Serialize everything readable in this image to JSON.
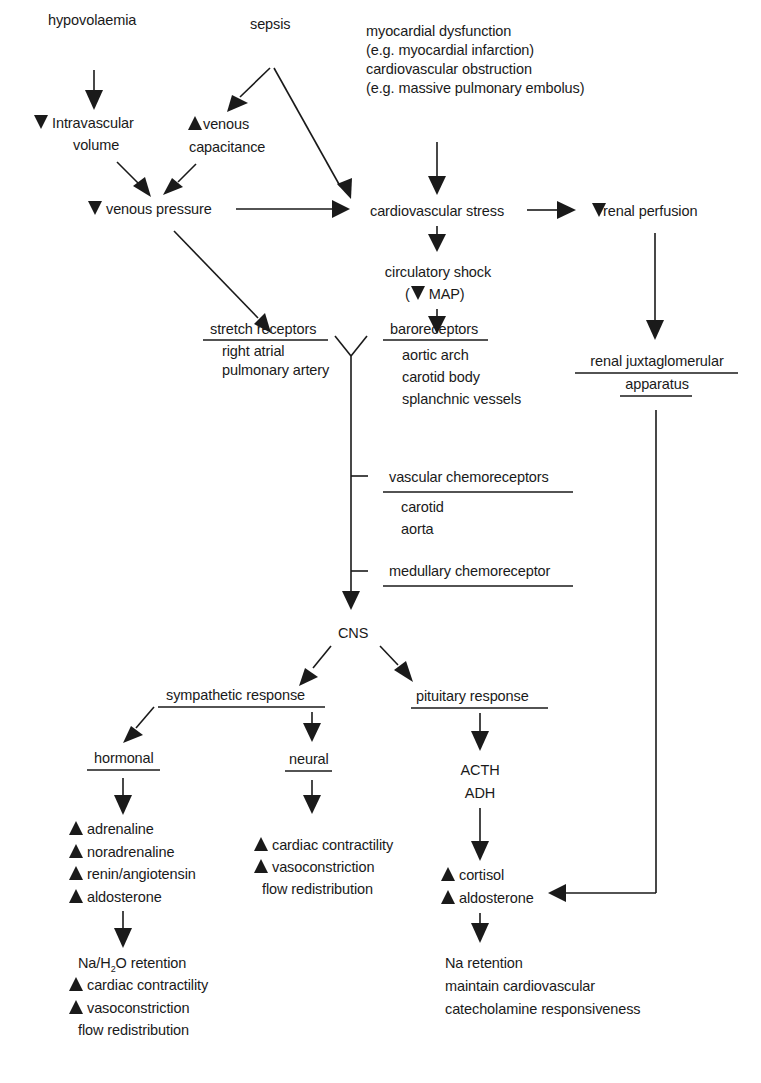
{
  "colors": {
    "ink": "#1a1a1a",
    "background": "#ffffff"
  },
  "causes": {
    "hypovolaemia": "hypovolaemia",
    "sepsis": "sepsis",
    "cardiac": [
      "myocardial dysfunction",
      "(e.g. myocardial infarction)",
      "cardiovascular obstruction",
      "(e.g. massive pulmonary embolus)"
    ]
  },
  "intermediate": {
    "intravascular_volume": {
      "icon": "down-triangle",
      "lines": [
        "Intravascular",
        "volume"
      ]
    },
    "venous_capacitance": {
      "icon": "up-triangle",
      "lines": [
        "venous",
        "capacitance"
      ]
    },
    "venous_pressure": {
      "icon": "down-triangle",
      "label": "venous pressure"
    },
    "cardiovascular_stress": "cardiovascular stress",
    "renal_perfusion": {
      "icon": "down-triangle",
      "label": "renal perfusion"
    },
    "circulatory_shock": {
      "label": "circulatory shock",
      "sub_prefix": "(",
      "sub_icon": "down-triangle",
      "sub_label": "MAP)"
    }
  },
  "receptors": {
    "stretch": {
      "title": "stretch receptors",
      "items": [
        "right atrial",
        "pulmonary artery"
      ]
    },
    "baro": {
      "title": "baroreceptors",
      "items": [
        "aortic arch",
        "carotid body",
        "splanchnic vessels"
      ]
    },
    "renal_jg": {
      "title_lines": [
        "renal juxtaglomerular",
        "apparatus"
      ]
    },
    "vascular_chemo": {
      "title": "vascular chemoreceptors",
      "items": [
        "carotid",
        "aorta"
      ]
    },
    "medullary_chemo": {
      "title": "medullary chemoreceptor"
    }
  },
  "cns": "CNS",
  "responses": {
    "sympathetic": "sympathetic response",
    "pituitary": "pituitary response",
    "hormonal": {
      "title": "hormonal",
      "items": [
        {
          "icon": "up-triangle",
          "label": "adrenaline"
        },
        {
          "icon": "up-triangle",
          "label": "noradrenaline"
        },
        {
          "icon": "up-triangle",
          "label": "renin/angiotensin"
        },
        {
          "icon": "up-triangle",
          "label": "aldosterone"
        }
      ],
      "effects": {
        "retention_prefix": "Na/H",
        "retention_sub": "2",
        "retention_suffix": "O retention",
        "items": [
          {
            "icon": "up-triangle",
            "label": "cardiac contractility"
          },
          {
            "icon": "up-triangle",
            "label": "vasoconstriction"
          },
          {
            "icon": "",
            "label": "flow redistribution"
          }
        ]
      }
    },
    "neural": {
      "title": "neural",
      "items": [
        {
          "icon": "up-triangle",
          "label": "cardiac contractility"
        },
        {
          "icon": "up-triangle",
          "label": "vasoconstriction"
        },
        {
          "icon": "",
          "label": "flow redistribution"
        }
      ]
    },
    "pituitary_hormones": [
      "ACTH",
      "ADH"
    ],
    "adrenal": [
      {
        "icon": "up-triangle",
        "label": "cortisol"
      },
      {
        "icon": "up-triangle",
        "label": "aldosterone"
      }
    ],
    "pituitary_effects": [
      "Na retention",
      "maintain cardiovascular",
      "catecholamine responsiveness"
    ]
  }
}
